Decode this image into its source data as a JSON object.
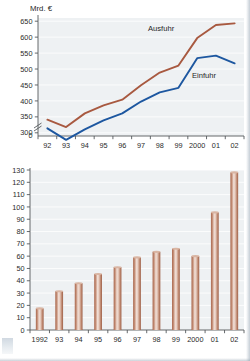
{
  "chart_data": [
    {
      "type": "line",
      "title": "",
      "ylabel": "Mrd. €",
      "xlabel": "",
      "categories": [
        "92",
        "93",
        "94",
        "95",
        "96",
        "97",
        "98",
        "99",
        "2000",
        "01",
        "02"
      ],
      "ytick_labels": [
        "0",
        "300",
        "350",
        "400",
        "450",
        "500",
        "550",
        "600",
        "650"
      ],
      "ylim": [
        290,
        660
      ],
      "axis_break": true,
      "grid": true,
      "legend_position": "inline-annotation",
      "series": [
        {
          "name": "Ausfuhr",
          "color": "#a85940",
          "values": [
            341,
            318,
            361,
            386,
            404,
            449,
            489,
            511,
            597,
            638,
            643
          ]
        },
        {
          "name": "Einfuhr",
          "color": "#1d57a0",
          "values": [
            314,
            278,
            311,
            339,
            361,
            398,
            427,
            441,
            534,
            542,
            518
          ]
        }
      ]
    },
    {
      "type": "bar",
      "title": "",
      "ylabel": "",
      "xlabel": "",
      "categories": [
        "1992",
        "93",
        "94",
        "95",
        "96",
        "97",
        "98",
        "99",
        "2000",
        "01",
        "02"
      ],
      "ytick_labels": [
        "0",
        "10",
        "20",
        "30",
        "40",
        "50",
        "60",
        "70",
        "80",
        "90",
        "100",
        "110",
        "120",
        "130"
      ],
      "ylim": [
        0,
        130
      ],
      "grid": true,
      "bar_color": "#c08a72",
      "values": [
        17.5,
        31.5,
        38,
        45.5,
        51,
        59,
        63.5,
        66,
        60,
        95.5,
        128
      ]
    }
  ],
  "colors": {
    "ausfuhr": "#a85940",
    "einfuhr": "#1d57a0",
    "bar": "#c08a72",
    "plot_background": "#eef1f3",
    "axis": "#55595c"
  }
}
